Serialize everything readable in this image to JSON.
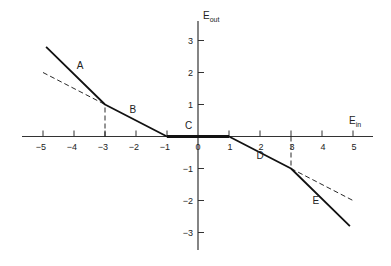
{
  "chart_data": {
    "type": "line",
    "title": "",
    "xlabel": "E",
    "xlabel_sub": "in",
    "ylabel": "E",
    "ylabel_sub": "out",
    "xlim": [
      -5.5,
      5.6
    ],
    "ylim": [
      -3.6,
      3.6
    ],
    "x_ticks": [
      -5,
      -4,
      -3,
      -2,
      -1,
      0,
      1,
      2,
      3,
      4,
      5
    ],
    "y_ticks": [
      3,
      2,
      1,
      -1,
      -2,
      -3
    ],
    "grid": false,
    "series": [
      {
        "name": "transfer characteristic",
        "style": "solid",
        "x": [
          -4.9,
          -3,
          -1,
          1,
          3,
          4.9
        ],
        "y": [
          2.8,
          1,
          0,
          0,
          -1,
          -2.8
        ]
      },
      {
        "name": "extension of B",
        "style": "dashed",
        "x": [
          -5,
          -3
        ],
        "y": [
          2,
          1
        ]
      },
      {
        "name": "extension of D",
        "style": "dashed",
        "x": [
          3,
          5
        ],
        "y": [
          -1,
          -2
        ]
      },
      {
        "name": "guide x=-3",
        "style": "dashed",
        "x": [
          -3,
          -3
        ],
        "y": [
          0,
          1
        ]
      },
      {
        "name": "guide x=3",
        "style": "dashed",
        "x": [
          3,
          3
        ],
        "y": [
          0,
          -1
        ]
      }
    ],
    "annotations": [
      {
        "text": "A",
        "x": -3.8,
        "y": 2.1
      },
      {
        "text": "B",
        "x": -2.1,
        "y": 0.75
      },
      {
        "text": "C",
        "x": -0.3,
        "y": 0.25
      },
      {
        "text": "D",
        "x": 2.0,
        "y": -0.7
      },
      {
        "text": "E",
        "x": 3.8,
        "y": -2.1
      }
    ]
  }
}
